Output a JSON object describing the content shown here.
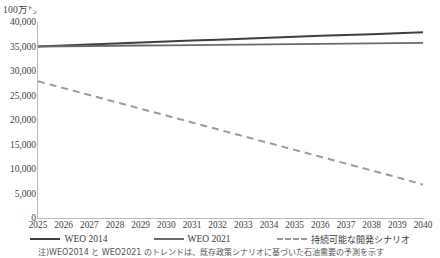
{
  "chart_data": {
    "type": "line",
    "title": "",
    "xlabel": "",
    "ylabel": "100万㌧",
    "unit_label": "100万㌧",
    "grid": false,
    "legend_position": "bottom",
    "ylim": [
      0,
      40000
    ],
    "ytick_labels": [
      "40,000",
      "35,000",
      "30,000",
      "25,000",
      "20,000",
      "15,000",
      "10,000",
      "5,000",
      "0"
    ],
    "ytick_values": [
      40000,
      35000,
      30000,
      25000,
      20000,
      15000,
      10000,
      5000,
      0
    ],
    "categories": [
      2025,
      2026,
      2027,
      2028,
      2029,
      2030,
      2031,
      2032,
      2033,
      2034,
      2035,
      2036,
      2037,
      2038,
      2039,
      2040
    ],
    "xtick_labels": [
      "2025",
      "2026",
      "2027",
      "2028",
      "2029",
      "2030",
      "2031",
      "2032",
      "2033",
      "2034",
      "2035",
      "2036",
      "2037",
      "2038",
      "2039",
      "2040"
    ],
    "series": [
      {
        "name": "WEO 2014",
        "style": "solid",
        "color": "#3f3f3f",
        "width": 2.0,
        "values": [
          35000,
          35200,
          35400,
          35600,
          35800,
          36000,
          36200,
          36400,
          36600,
          36800,
          37000,
          37200,
          37350,
          37500,
          37700,
          37900
        ]
      },
      {
        "name": "WEO 2021",
        "style": "solid",
        "color": "#6b6b6b",
        "width": 1.8,
        "values": [
          35000,
          35050,
          35100,
          35150,
          35200,
          35250,
          35300,
          35350,
          35400,
          35450,
          35500,
          35550,
          35600,
          35650,
          35700,
          35750
        ]
      },
      {
        "name": "持続可能な開発シナリオ",
        "style": "dashed",
        "color": "#9a9a9a",
        "width": 2.0,
        "values": [
          27900,
          26500,
          25100,
          23700,
          22300,
          20900,
          19500,
          18100,
          16700,
          15300,
          13900,
          12500,
          11100,
          9700,
          8300,
          6800
        ]
      }
    ]
  },
  "legend": {
    "items": [
      {
        "label": "WEO 2014",
        "style": "solid",
        "color": "#3f3f3f"
      },
      {
        "label": "WEO 2021",
        "style": "solid",
        "color": "#6b6b6b"
      },
      {
        "label": "持続可能な開発シナリオ",
        "style": "dashed",
        "color": "#9a9a9a"
      }
    ]
  },
  "caption": "注)WEO2014 と WEO2021 のトレンドは、既存政策シナリオに基づいた石油需要の予測を示す"
}
